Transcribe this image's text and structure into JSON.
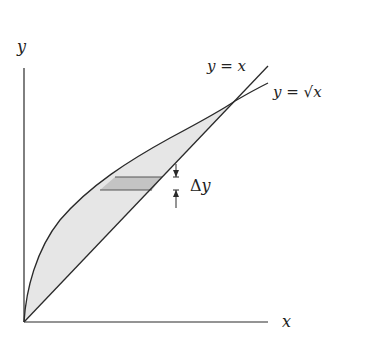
{
  "diagram": {
    "type": "region-between-curves",
    "axes": {
      "x_label": "x",
      "y_label": "y"
    },
    "curves": [
      {
        "name": "line",
        "label": "y = x"
      },
      {
        "name": "sqrt",
        "label": "y = √x"
      }
    ],
    "strip": {
      "label": "Δy",
      "delta_symbol": "Δ",
      "var": "y"
    },
    "colors": {
      "stroke": "#2a2a2a",
      "region_fill": "#e6e6e6",
      "strip_fill": "#c4c4c4"
    }
  }
}
